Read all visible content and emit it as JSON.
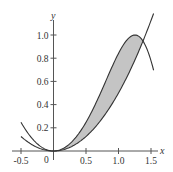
{
  "chart_data": {
    "type": "line",
    "title": "",
    "xlabel": "x",
    "ylabel": "y",
    "xlim": [
      -0.55,
      1.55
    ],
    "ylim": [
      0,
      1.15
    ],
    "grid": false,
    "legend": null,
    "x_ticks": [
      -0.5,
      0.5,
      1.0,
      1.5
    ],
    "x_tick_labels": [
      "-0.5",
      "0.5",
      "1.0",
      "1.5"
    ],
    "y_ticks": [
      0.2,
      0.4,
      0.6,
      0.8,
      1.0
    ],
    "y_tick_labels": [
      "0.2",
      "0.4",
      "0.6",
      "0.8",
      "1.0"
    ],
    "origin_label": "0",
    "series": [
      {
        "name": "y = sin(x^2)",
        "x_range": [
          -0.5,
          1.54
        ],
        "x": [
          -0.5,
          0,
          0.5,
          1.0,
          1.25,
          1.38,
          1.5
        ],
        "values": [
          0.25,
          0,
          0.25,
          0.84,
          1.0,
          0.94,
          0.78
        ]
      },
      {
        "name": "y = x^2/2",
        "x_range": [
          -0.5,
          1.54
        ],
        "x": [
          -0.5,
          0,
          0.5,
          1.0,
          1.38,
          1.54
        ],
        "values": [
          0.13,
          0,
          0.13,
          0.5,
          0.95,
          1.19
        ]
      }
    ],
    "shaded_region": {
      "between": [
        "y = sin(x^2)",
        "y = x^2/2"
      ],
      "x_from": 0,
      "x_to": 1.38,
      "fill": "#c4c4c4"
    },
    "colors": {
      "line": "#333333",
      "axis": "#555555",
      "fill": "#c4c4c4"
    }
  }
}
